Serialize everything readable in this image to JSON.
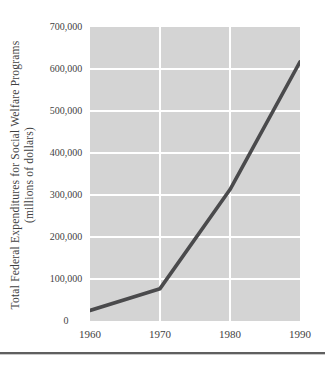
{
  "figure": {
    "y_axis_title_line1": "Total Federal Expenditures for Social Welfare Programs",
    "y_axis_title_line2": "(millions of dollars)"
  },
  "chart_data": {
    "type": "line",
    "title": "",
    "xlabel": "",
    "ylabel": "Total Federal Expenditures for Social Welfare Programs (millions of dollars)",
    "x": [
      1960,
      1970,
      1980,
      1990
    ],
    "x_tick_labels": [
      "1960",
      "1970",
      "1980",
      "1990"
    ],
    "series": [
      {
        "name": "Total federal expenditures for social welfare programs",
        "values": [
          25000,
          77000,
          313000,
          617000
        ]
      }
    ],
    "xlim": [
      1960,
      1990
    ],
    "ylim": [
      0,
      700000
    ],
    "y_ticks": [
      0,
      100000,
      200000,
      300000,
      400000,
      500000,
      600000,
      700000
    ],
    "y_tick_labels": [
      "0",
      "100,000",
      "200,000",
      "300,000",
      "400,000",
      "500,000",
      "600,000",
      "700,000"
    ],
    "grid": true,
    "legend": "none",
    "colors": {
      "plot_background": "#d4d4d4",
      "gridline": "#ffffff",
      "data_line": "#4a4a4c",
      "text": "#3f3f3f",
      "bottom_rule": "#5f5f5f"
    }
  }
}
